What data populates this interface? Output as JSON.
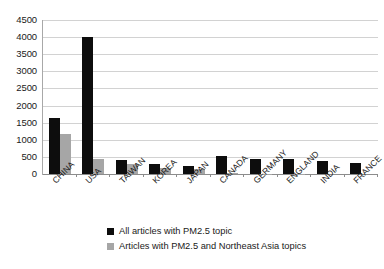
{
  "chart_data": {
    "type": "bar",
    "title": "",
    "subtitle": "",
    "xlabel": "",
    "ylabel": "",
    "categories": [
      "CHINA",
      "USA",
      "TAIWAN",
      "KOREA",
      "JAPAN",
      "CANADA",
      "GERMANY",
      "ENGLAND",
      "INDIA",
      "FRANCE"
    ],
    "series": [
      {
        "name": "All articles with PM2.5 topic",
        "color": "#0d0d0d",
        "values": [
          1650,
          3990,
          400,
          290,
          240,
          520,
          440,
          430,
          390,
          330
        ]
      },
      {
        "name": "Articles with PM2.5 and Northeast Asia topics",
        "color": "#a6a6a6",
        "values": [
          1180,
          430,
          290,
          190,
          150,
          40,
          15,
          10,
          0,
          0
        ]
      }
    ],
    "ylim": [
      0,
      4500
    ],
    "ytick_step": 500,
    "yticks": [
      "4500",
      "4000",
      "3500",
      "3000",
      "2500",
      "2000",
      "1500",
      "1000",
      "500",
      "0"
    ],
    "grid": true,
    "legend_position": "bottom"
  }
}
